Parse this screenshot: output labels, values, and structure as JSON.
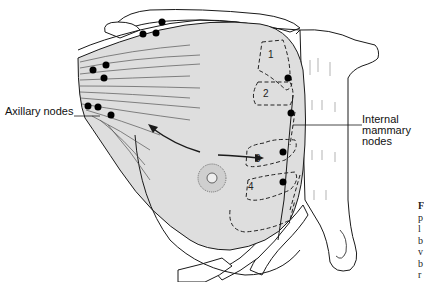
{
  "figure": {
    "colors": {
      "breast_fill": "#dedede",
      "outline": "#1a1a1a",
      "node": "#000000",
      "background": "#ffffff"
    },
    "labels": {
      "axillary": "Axillary nodes",
      "internal_line1": "Internal",
      "internal_line2": "mammary",
      "internal_line3": "nodes"
    },
    "intercostal_spaces": [
      "1",
      "2",
      "3",
      "4"
    ],
    "caption_fragment_letters": [
      "F",
      "p",
      "l",
      "b",
      "v",
      "b",
      "r"
    ]
  }
}
